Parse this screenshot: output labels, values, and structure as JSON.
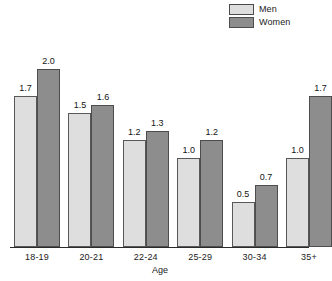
{
  "chart_data": {
    "type": "bar",
    "title": "",
    "subtitle": "",
    "xlabel": "Age",
    "ylabel": "",
    "categories": [
      "18-19",
      "20-21",
      "22-24",
      "25-29",
      "30-34",
      "35+"
    ],
    "series": [
      {
        "name": "Men",
        "color": "#dedede",
        "values": [
          1.7,
          1.5,
          1.2,
          1.0,
          0.5,
          1.0
        ]
      },
      {
        "name": "Women",
        "color": "#8d8d8d",
        "values": [
          2.0,
          1.6,
          1.3,
          1.2,
          0.7,
          1.7
        ]
      }
    ],
    "value_labels": {
      "Men": [
        "1.7",
        "1.5",
        "1.2",
        "1.0",
        "0.5",
        "1.0"
      ],
      "Women": [
        "2.0",
        "1.6",
        "1.3",
        "1.2",
        "0.7",
        "1.7"
      ]
    },
    "ylim": [
      0,
      2.3
    ],
    "grid": false,
    "legend_position": "top-right",
    "data_labels": true
  },
  "legend": {
    "entries": [
      {
        "label": "Men",
        "color": "#dedede"
      },
      {
        "label": "Women",
        "color": "#8d8d8d"
      }
    ]
  },
  "axis": {
    "x_title": "Age",
    "x_ticks": [
      "18-19",
      "20-21",
      "22-24",
      "25-29",
      "30-34",
      "35+"
    ]
  }
}
